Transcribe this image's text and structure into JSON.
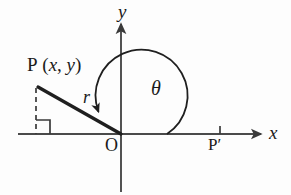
{
  "figure": {
    "background_color": "#fdfdfd",
    "stroke_color": "#2b2b2b",
    "axis_color": "#4a4a4a",
    "labels": {
      "y_axis": "y",
      "x_axis": "x",
      "point_p": "P",
      "point_p_coords_open": "(",
      "point_p_x": "x",
      "point_p_comma": ", ",
      "point_p_y": "y",
      "point_p_coords_close": ")",
      "radius": "r",
      "angle": "θ",
      "origin": "O",
      "point_p_prime": "P′"
    },
    "geometry": {
      "origin": [
        121,
        134
      ],
      "point_p": [
        36,
        86
      ],
      "foot_of_perpendicular": [
        36,
        134
      ],
      "point_p_prime_tick": [
        220,
        134
      ],
      "x_axis_start": [
        18,
        134
      ],
      "x_axis_end": [
        263,
        134
      ],
      "y_axis_top": [
        121,
        22
      ],
      "y_axis_bottom": [
        121,
        192
      ],
      "angle_arc_radius": 46,
      "right_angle_marker_size": 14
    }
  }
}
